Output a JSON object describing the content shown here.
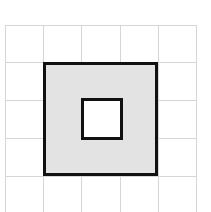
{
  "figure": {
    "background_color": "#ffffff",
    "width": 211,
    "height": 212
  },
  "grid": {
    "line_color": "#d6d6d6",
    "line_width": 1,
    "cell_size": 38,
    "columns": 5,
    "rows": 5,
    "origin_x": 5,
    "origin_y": 25,
    "vertical_line_positions": [
      5,
      43,
      81,
      120,
      158,
      196
    ],
    "horizontal_line_positions": [
      25,
      62,
      100,
      138,
      176,
      212
    ]
  },
  "chart_data": {
    "type": "diagram",
    "units": "grid cells",
    "shapes": [
      {
        "name": "outer-square",
        "role": "shaded-region",
        "kind": "square",
        "fill": "#e3e3e3",
        "stroke": "#111111",
        "stroke_width": 3,
        "x": 43,
        "y": 62,
        "width": 115,
        "height": 114,
        "side_cells": 3,
        "area_cells": 9
      },
      {
        "name": "inner-square-hole",
        "role": "hole",
        "kind": "square",
        "fill": "#ffffff",
        "stroke": "#111111",
        "stroke_width": 3,
        "x": 81,
        "y": 98,
        "width": 42,
        "height": 42,
        "side_cells": 1,
        "area_cells": 1
      }
    ],
    "shaded_area_cells": 8,
    "xlabel": "",
    "ylabel": "",
    "legend": [],
    "grid": true
  }
}
